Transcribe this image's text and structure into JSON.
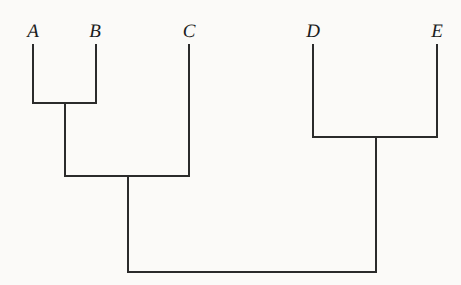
{
  "figure": {
    "kind": "cladogram",
    "background_color": "#fbfaf8",
    "line_color": "#2b2b2b",
    "line_width": 1.6,
    "width": 461,
    "height": 285
  },
  "taxa": [
    {
      "label": "A",
      "x": 33,
      "label_x": 33,
      "label_y": 22,
      "tip_y": 45
    },
    {
      "label": "B",
      "x": 96,
      "label_x": 95,
      "label_y": 22,
      "tip_y": 45
    },
    {
      "label": "C",
      "x": 189,
      "label_x": 189,
      "label_y": 22,
      "tip_y": 45
    },
    {
      "label": "D",
      "x": 313,
      "label_x": 313,
      "label_y": 22,
      "tip_y": 45
    },
    {
      "label": "E",
      "x": 437,
      "label_x": 437,
      "label_y": 22,
      "tip_y": 45
    }
  ],
  "nodes": [
    {
      "name": "node-ab",
      "children": [
        "A",
        "B"
      ],
      "left_x": 33,
      "right_x": 96,
      "y": 103,
      "stem_x": 65
    },
    {
      "name": "node-abc",
      "children": [
        "node-ab",
        "C"
      ],
      "left_x": 65,
      "right_x": 189,
      "y": 176,
      "stem_x": 128
    },
    {
      "name": "node-de",
      "children": [
        "D",
        "E"
      ],
      "left_x": 313,
      "right_x": 437,
      "y": 137,
      "stem_x": 376
    },
    {
      "name": "node-root",
      "children": [
        "node-abc",
        "node-de"
      ],
      "left_x": 128,
      "right_x": 376,
      "y": 272,
      "stem_x": 252
    }
  ],
  "branches": [
    {
      "name": "branch-A",
      "x1": 33,
      "y1": 45,
      "x2": 33,
      "y2": 103
    },
    {
      "name": "branch-B",
      "x1": 96,
      "y1": 45,
      "x2": 96,
      "y2": 103
    },
    {
      "name": "branch-C",
      "x1": 189,
      "y1": 45,
      "x2": 189,
      "y2": 176
    },
    {
      "name": "branch-D",
      "x1": 313,
      "y1": 45,
      "x2": 313,
      "y2": 137
    },
    {
      "name": "branch-E",
      "x1": 437,
      "y1": 45,
      "x2": 437,
      "y2": 137
    },
    {
      "name": "crossbar-ab",
      "x1": 33,
      "y1": 103,
      "x2": 96,
      "y2": 103
    },
    {
      "name": "branch-ab-stem",
      "x1": 65,
      "y1": 103,
      "x2": 65,
      "y2": 176
    },
    {
      "name": "crossbar-abc",
      "x1": 65,
      "y1": 176,
      "x2": 189,
      "y2": 176
    },
    {
      "name": "branch-abc-stem",
      "x1": 128,
      "y1": 176,
      "x2": 128,
      "y2": 272
    },
    {
      "name": "crossbar-de",
      "x1": 313,
      "y1": 137,
      "x2": 437,
      "y2": 137
    },
    {
      "name": "branch-de-stem",
      "x1": 376,
      "y1": 137,
      "x2": 376,
      "y2": 272
    },
    {
      "name": "crossbar-root",
      "x1": 128,
      "y1": 272,
      "x2": 376,
      "y2": 272
    }
  ]
}
